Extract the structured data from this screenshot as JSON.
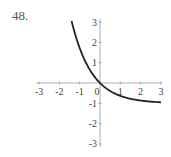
{
  "problem": {
    "number": "48."
  },
  "chart_data": {
    "type": "line",
    "title": "",
    "xlabel": "",
    "ylabel": "",
    "xlim": [
      -3,
      3
    ],
    "ylim": [
      -3,
      3
    ],
    "grid": false,
    "legend": null,
    "x_ticks": [
      "-3",
      "-2",
      "-1",
      "0",
      "1",
      "2",
      "3"
    ],
    "y_ticks": [
      "3",
      "2",
      "1",
      "-1",
      "-2",
      "-3"
    ],
    "series": [
      {
        "name": "curve",
        "description": "decreasing exponential, approx y = e^(-x) - 1",
        "x": [
          -1.4,
          -1.0,
          -0.5,
          0,
          0.5,
          1.0,
          1.5,
          2.0,
          2.5,
          3.0
        ],
        "y": [
          3.06,
          1.72,
          0.65,
          0,
          -0.39,
          -0.63,
          -0.78,
          -0.86,
          -0.92,
          -0.95
        ],
        "color": "#222222"
      }
    ]
  },
  "layout": {
    "origin_px": [
      100,
      83
    ],
    "unit_px": 20.3
  }
}
